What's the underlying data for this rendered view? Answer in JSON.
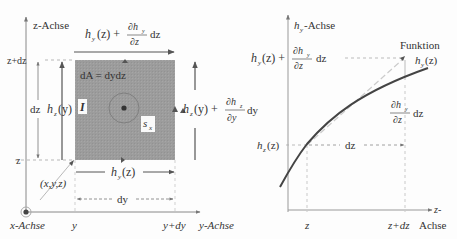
{
  "left_diagram": {
    "z_axis_label": "z-Achse",
    "y_axis_label": "y-Achse",
    "x_axis_label": "x-Achse",
    "top_field_label": {
      "base": "h",
      "sub": "y",
      "arg": "(z) +",
      "num": "∂h",
      "num_sub": "y",
      "den": "∂z",
      "tail": "dz"
    },
    "bottom_field_label": {
      "base": "h",
      "sub": "y",
      "arg": "(z)"
    },
    "left_field_label": {
      "base": "h",
      "sub": "z",
      "arg": "(y)"
    },
    "right_field_label": {
      "base": "h",
      "sub": "z",
      "arg": "(y) +",
      "num": "∂h",
      "num_sub": "z",
      "den": "∂y",
      "tail": "dy"
    },
    "area_label": "dA = dydz",
    "current_label": "I",
    "path_label": {
      "base": "s",
      "sub": "x"
    },
    "z_plus_dz": "z+dz",
    "z": "z",
    "dz": "dz",
    "dy": "dy",
    "y": "y",
    "y_plus_dy": "y+dy",
    "point_label": "(x,y,z)",
    "colors": {
      "square_fill": "#9a9a9a",
      "axis": "#666666"
    }
  },
  "right_diagram": {
    "vertical_axis_label": {
      "base": "h",
      "sub": "y",
      "tail": "-Achse"
    },
    "horizontal_axis_label_1": "z-",
    "horizontal_axis_label_2": "Achse",
    "top_value_label": {
      "base": "h",
      "sub": "y",
      "arg": "(z) +",
      "num": "∂h",
      "num_sub": "y",
      "den": "∂z",
      "tail": "dz"
    },
    "function_label": "Funktion",
    "function_value": {
      "base": "h",
      "sub": "y",
      "arg": "(z)"
    },
    "increment_label": {
      "num": "∂h",
      "num_sub": "y",
      "den": "∂z",
      "tail": "dz"
    },
    "hz_label": {
      "base": "h",
      "sub": "z",
      "arg": "(z)"
    },
    "dz_label": "dz",
    "z_tick": "z",
    "z_plus_dz_tick": "z+dz",
    "colors": {
      "curve": "#444444",
      "axis": "#888888"
    }
  }
}
